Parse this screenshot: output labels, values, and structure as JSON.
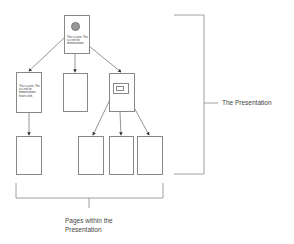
{
  "diagram": {
    "type": "presentation-page-hierarchy",
    "nodes": [
      {
        "id": "root",
        "role": "home page",
        "has_image": true,
        "text": "This is a text. This is a text for demonstration."
      },
      {
        "id": "child-left",
        "text": "This is a text. This is a text for demonstration. Insert a link"
      },
      {
        "id": "child-middle",
        "text": ""
      },
      {
        "id": "child-right",
        "has_image_map": true,
        "text": ""
      },
      {
        "id": "leaf-1",
        "parent": "child-left"
      },
      {
        "id": "leaf-2",
        "parent": "child-right"
      },
      {
        "id": "leaf-3",
        "parent": "child-right"
      },
      {
        "id": "leaf-4",
        "parent": "child-right"
      }
    ],
    "labels": {
      "presentation": "The Presentation",
      "pages_line1": "Pages within the",
      "pages_line2": "Presentation"
    },
    "colors": {
      "line": "#888888",
      "arrow": "#333333",
      "circle": "#999999"
    }
  }
}
